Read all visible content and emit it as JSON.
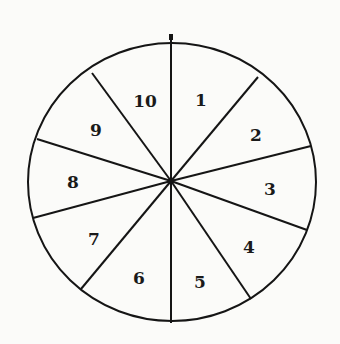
{
  "diagram": {
    "type": "spinner-wheel",
    "sectors": 10,
    "labels": [
      "1",
      "2",
      "3",
      "4",
      "5",
      "6",
      "7",
      "8",
      "9",
      "10"
    ],
    "pointer": "arrow-top"
  }
}
